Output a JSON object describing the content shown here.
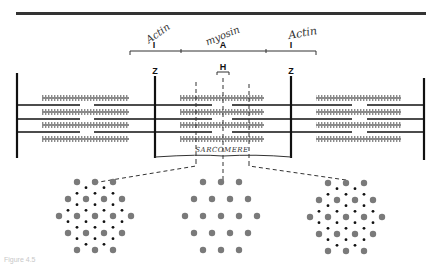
{
  "diagram": {
    "band_labels": {
      "left_I": "I",
      "A": "A",
      "right_I": "I",
      "H": "H",
      "Z_left": "Z",
      "Z_right": "Z"
    },
    "handwritten": {
      "left": "Actin",
      "center": "myosin",
      "right": "Actin",
      "bottom": "SARCOMERE"
    },
    "cross_sections": [
      {
        "name": "I-A overlap region",
        "pattern": "hexagonal thick filaments with interleaved thin filaments"
      },
      {
        "name": "H zone",
        "pattern": "thick filaments only"
      },
      {
        "name": "A-I overlap region",
        "pattern": "hexagonal thick filaments with interleaved thin filaments"
      }
    ],
    "caption": "Figure 4.5",
    "colors": {
      "line": "#111111",
      "thick_filament": "#8a8a8a",
      "thin_dot": "#111111",
      "thick_dot": "#7a7a7a"
    }
  }
}
